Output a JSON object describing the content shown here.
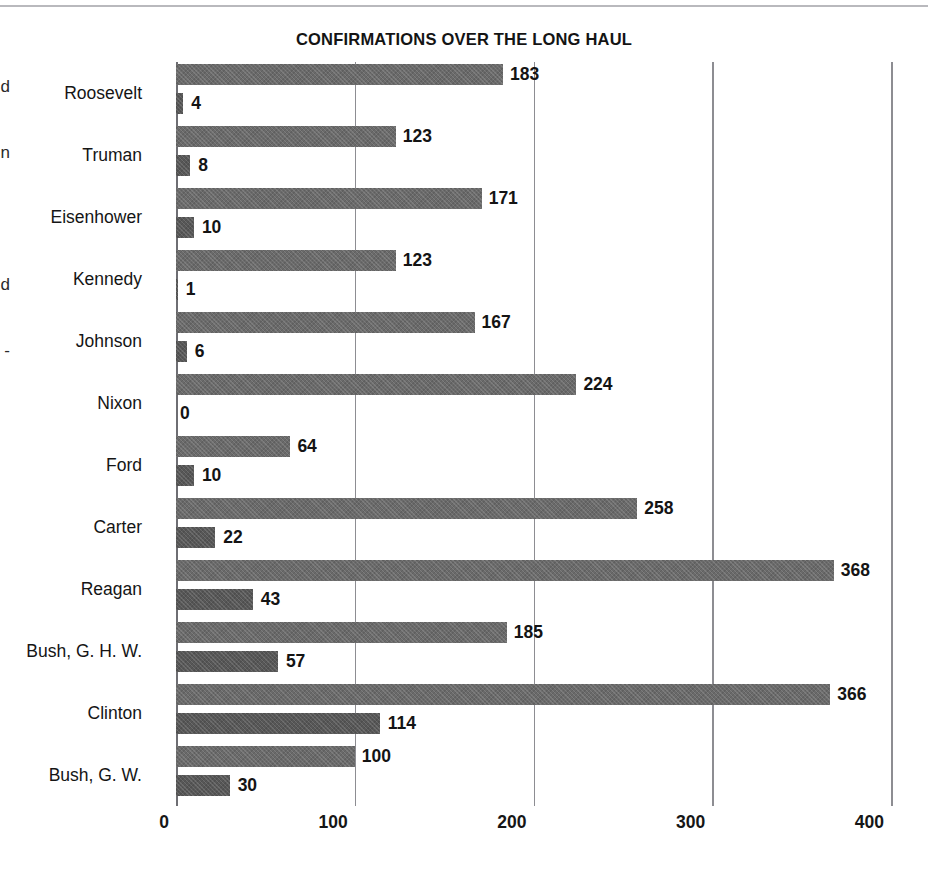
{
  "title": "CONFIRMATIONS OVER THE LONG HAUL",
  "margin_fragments": [
    "d",
    "n",
    "",
    "d",
    "-"
  ],
  "axis": {
    "ticks": [
      "0",
      "100",
      "200",
      "300",
      "400"
    ],
    "tick_values": [
      0,
      100,
      200,
      300,
      400
    ],
    "xlabel": "",
    "min": 0,
    "max": 400
  },
  "colors": {
    "series_a": "#6a6a6a",
    "series_b": "#575757",
    "gridline": "#8d8d92",
    "text": "#151515",
    "rule": "#b9b9bd"
  },
  "chart_data": {
    "type": "bar",
    "title": "CONFIRMATIONS OVER THE LONG HAUL",
    "xlabel": "",
    "ylabel": "",
    "xlim": [
      0,
      400
    ],
    "grid": true,
    "orientation": "horizontal",
    "legend": "none",
    "categories": [
      "Roosevelt",
      "Truman",
      "Eisenhower",
      "Kennedy",
      "Johnson",
      "Nixon",
      "Ford",
      "Carter",
      "Reagan",
      "Bush, G. H. W.",
      "Clinton",
      "Bush, G. W."
    ],
    "series": [
      {
        "name": "series-a",
        "values": [
          183,
          123,
          171,
          123,
          167,
          224,
          64,
          258,
          368,
          185,
          366,
          100
        ]
      },
      {
        "name": "series-b",
        "values": [
          4,
          8,
          10,
          1,
          6,
          0,
          10,
          22,
          43,
          57,
          114,
          30
        ]
      }
    ]
  }
}
